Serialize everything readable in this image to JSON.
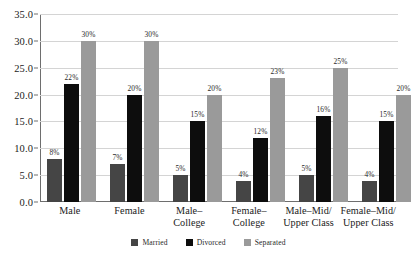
{
  "chart_data": {
    "type": "bar",
    "title": "",
    "subtitle": "",
    "xlabel": "",
    "ylabel": "",
    "ylim": [
      0,
      35
    ],
    "ytick_step": 5,
    "grid": true,
    "legend_position": "bottom-center",
    "value_label_suffix": "%",
    "categories": [
      "Male",
      "Female",
      "Male–\nCollege",
      "Female–\nCollege",
      "Male–Mid/\nUpper Class",
      "Female–Mid/\nUpper Class"
    ],
    "ytick_labels": [
      "0.0",
      "5.0",
      "10.0",
      "15.0",
      "20.0",
      "25.0",
      "30.0",
      "35.0"
    ],
    "ytick_values": [
      0,
      5,
      10,
      15,
      20,
      25,
      30,
      35
    ],
    "series": [
      {
        "name": "Married",
        "color": "#454545",
        "values": [
          8,
          7,
          5,
          4,
          5,
          4
        ],
        "labels": [
          "8%",
          "7%",
          "5%",
          "4%",
          "5%",
          "4%"
        ]
      },
      {
        "name": "Divorced",
        "color": "#0d0d0d",
        "values": [
          22,
          20,
          15,
          12,
          16,
          15
        ],
        "labels": [
          "22%",
          "20%",
          "15%",
          "12%",
          "16%",
          "15%"
        ]
      },
      {
        "name": "Separated",
        "color": "#9a9a9a",
        "values": [
          30,
          30,
          20,
          23,
          25,
          20
        ],
        "labels": [
          "30%",
          "30%",
          "20%",
          "23%",
          "25%",
          "20%"
        ]
      }
    ]
  },
  "axis": {
    "line_color": "#6e6e6e",
    "grid_color": "#d4d4d4"
  }
}
